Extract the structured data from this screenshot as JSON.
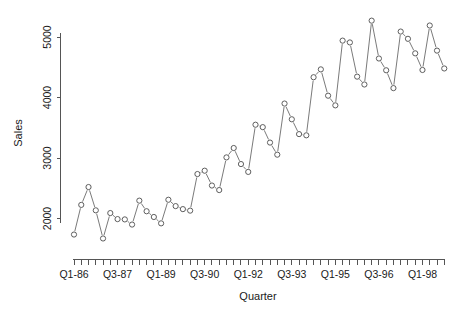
{
  "chart_data": {
    "type": "line",
    "title": "",
    "subtitle": "",
    "xlabel": "Quarter",
    "ylabel": "Sales",
    "grid": false,
    "legend": false,
    "legend_position": "none",
    "marker": "open-circle",
    "line_style": "solid",
    "point_color": "#4d4d4d",
    "line_color": "#6b6b6b",
    "xlim_index": [
      1,
      52
    ],
    "ylim": [
      1640,
      5280
    ],
    "yticks": [
      2000,
      3000,
      4000,
      5000
    ],
    "ytick_labels": [
      "2000",
      "3000",
      "4000",
      "5000"
    ],
    "xtick_count": 52,
    "xtick_labels_shown": [
      "Q1-86",
      "Q3-87",
      "Q1-89",
      "Q3-90",
      "Q1-92",
      "Q3-93",
      "Q1-95",
      "Q3-96",
      "Q1-98"
    ],
    "xtick_label_indices": [
      1,
      7,
      13,
      19,
      25,
      31,
      37,
      43,
      49
    ],
    "categories": [
      "Q1-86",
      "Q2-86",
      "Q3-86",
      "Q4-86",
      "Q1-87",
      "Q2-87",
      "Q3-87",
      "Q4-87",
      "Q1-88",
      "Q2-88",
      "Q3-88",
      "Q4-88",
      "Q1-89",
      "Q2-89",
      "Q3-89",
      "Q4-89",
      "Q1-90",
      "Q2-90",
      "Q3-90",
      "Q4-90",
      "Q1-91",
      "Q2-91",
      "Q3-91",
      "Q4-91",
      "Q1-92",
      "Q2-92",
      "Q3-92",
      "Q4-92",
      "Q1-93",
      "Q2-93",
      "Q3-93",
      "Q4-93",
      "Q1-94",
      "Q2-94",
      "Q3-94",
      "Q4-94",
      "Q1-95",
      "Q2-95",
      "Q3-95",
      "Q4-95",
      "Q1-96",
      "Q2-96",
      "Q3-96",
      "Q4-96",
      "Q1-97",
      "Q2-97",
      "Q3-97",
      "Q4-97",
      "Q1-98",
      "Q2-98",
      "Q3-98",
      "Q4-98"
    ],
    "values": [
      1735,
      2225,
      2520,
      2135,
      1670,
      2090,
      1990,
      1985,
      1900,
      2295,
      2120,
      2025,
      1920,
      2310,
      2205,
      2155,
      2130,
      2735,
      2790,
      2545,
      2470,
      3010,
      3165,
      2900,
      2770,
      3550,
      3510,
      3255,
      3055,
      3900,
      3640,
      3395,
      3375,
      4335,
      4465,
      4030,
      3870,
      4940,
      4910,
      4345,
      4215,
      5270,
      4645,
      4450,
      4155,
      5090,
      4970,
      4730,
      4455,
      5190,
      4775,
      4480
    ]
  }
}
